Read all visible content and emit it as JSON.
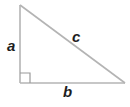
{
  "diagram": {
    "type": "right-triangle",
    "colors": {
      "stroke": "#b4b4b4",
      "label": "#1e1e1e",
      "background": "#ffffff"
    },
    "vertices": {
      "top": [
        20,
        5
      ],
      "right_angle": [
        20,
        83
      ],
      "right": [
        125,
        83
      ]
    },
    "right_angle_marker_size": 10,
    "labels": {
      "side_a": "a",
      "side_b": "b",
      "hypotenuse_c": "c"
    }
  }
}
